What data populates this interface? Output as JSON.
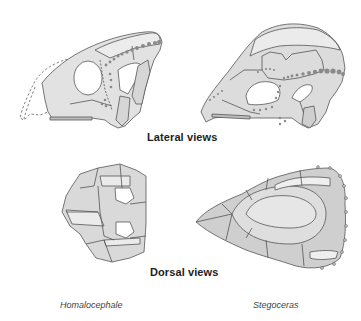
{
  "figure": {
    "headings": {
      "lateral": "Lateral views",
      "dorsal": "Dorsal views"
    },
    "species": {
      "left": "Homalocephale",
      "right": "Stegoceras"
    },
    "colors": {
      "bone_light": "#ececec",
      "bone_mid": "#d9d9d9",
      "bone_dark": "#c4c4c4",
      "outline": "#555555",
      "dots": "#8a8a8a",
      "text": "#1e1e1e"
    },
    "panels": [
      {
        "view": "lateral",
        "species": "Homalocephale",
        "position": "top-left"
      },
      {
        "view": "lateral",
        "species": "Stegoceras",
        "position": "top-right"
      },
      {
        "view": "dorsal",
        "species": "Homalocephale",
        "position": "bottom-left"
      },
      {
        "view": "dorsal",
        "species": "Stegoceras",
        "position": "bottom-right"
      }
    ]
  }
}
